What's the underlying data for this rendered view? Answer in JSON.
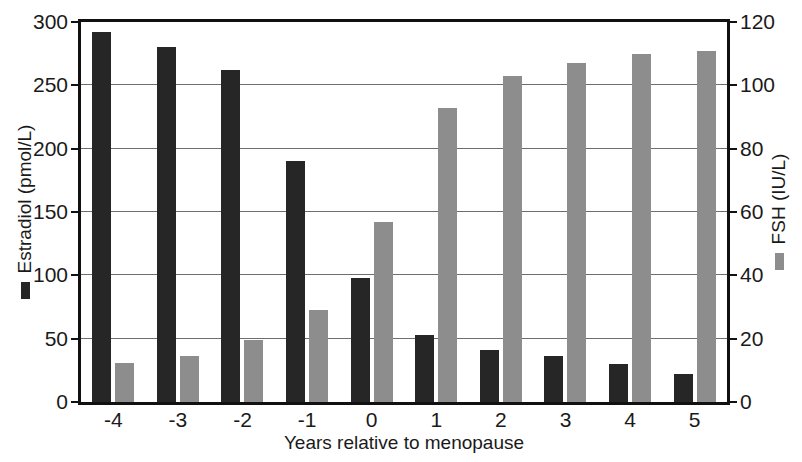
{
  "chart_data": {
    "type": "bar",
    "title": "",
    "subtitle": "",
    "xlabel": "Years relative to menopause",
    "categories": [
      "-4",
      "-3",
      "-2",
      "-1",
      "0",
      "1",
      "2",
      "3",
      "4",
      "5"
    ],
    "grid": true,
    "legend_position": "axis-titles",
    "axes": {
      "left": {
        "label": "Estradiol (pmol/L)",
        "ticks": [
          0,
          50,
          100,
          150,
          200,
          250,
          300
        ],
        "tick_labels": [
          "0",
          "50",
          "100",
          "150",
          "200",
          "250",
          "300"
        ],
        "ylim": [
          0,
          300
        ],
        "color": "#262626"
      },
      "right": {
        "label": "FSH (IU/L)",
        "ticks": [
          0,
          20,
          40,
          60,
          80,
          100,
          120
        ],
        "tick_labels": [
          "0",
          "20",
          "40",
          "60",
          "80",
          "100",
          "120"
        ],
        "ylim": [
          0,
          120
        ],
        "color": "#8d8d8d"
      }
    },
    "series": [
      {
        "name": "Estradiol (pmol/L)",
        "axis": "left",
        "color": "#262626",
        "values": [
          292,
          280,
          262,
          190,
          98,
          53,
          41,
          36,
          30,
          22
        ]
      },
      {
        "name": "FSH (IU/L)",
        "axis": "right",
        "color": "#8d8d8d",
        "values": [
          12.4,
          14.4,
          19.6,
          29.2,
          56.8,
          93.0,
          103.0,
          107.0,
          110.0,
          111.0
        ]
      }
    ]
  }
}
